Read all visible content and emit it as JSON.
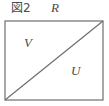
{
  "figure": {
    "caption": "図2",
    "labels": {
      "top": "R",
      "upper_left_region": "V",
      "lower_right_region": "U"
    },
    "colors": {
      "stroke": "#6e6e6e",
      "text": "#4a4a4a",
      "background": "#ffffff"
    },
    "geometry": {
      "rect": {
        "x": 5,
        "y": 21,
        "width": 98,
        "height": 79
      },
      "diagonal": {
        "x1": 5,
        "y1": 100,
        "x2": 103,
        "y2": 21
      },
      "stroke_width": 1.2
    }
  }
}
